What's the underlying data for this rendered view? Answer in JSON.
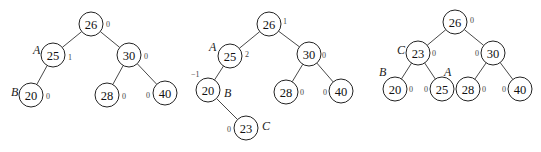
{
  "trees": [
    {
      "id": "tree-1",
      "nodes": [
        {
          "key": "n26",
          "value": "26",
          "x": 91,
          "y": 24,
          "bf": "0",
          "bf_dx": 15,
          "bf_dy": 0,
          "label": "",
          "label_dx": 0,
          "label_dy": 0
        },
        {
          "key": "n25",
          "value": "25",
          "x": 53,
          "y": 55,
          "bf": "1",
          "bf_dx": 15,
          "bf_dy": 2,
          "label": "A",
          "label_dx": -20,
          "label_dy": -5
        },
        {
          "key": "n30",
          "value": "30",
          "x": 129,
          "y": 55,
          "bf": "0",
          "bf_dx": 15,
          "bf_dy": 1,
          "label": "",
          "label_dx": 0,
          "label_dy": 0
        },
        {
          "key": "n20",
          "value": "20",
          "x": 31,
          "y": 95,
          "bf": "0",
          "bf_dx": 15,
          "bf_dy": 1,
          "label": "B",
          "label_dx": -20,
          "label_dy": -3
        },
        {
          "key": "n28",
          "value": "28",
          "x": 107,
          "y": 95,
          "bf": "0",
          "bf_dx": 15,
          "bf_dy": 1,
          "label": "",
          "label_dx": 0,
          "label_dy": 0
        },
        {
          "key": "n40",
          "value": "40",
          "x": 165,
          "y": 93,
          "bf": "0",
          "bf_dx": -19,
          "bf_dy": 2,
          "label": "",
          "label_dx": 0,
          "label_dy": 0
        }
      ],
      "edges": [
        [
          "n26",
          "n25"
        ],
        [
          "n26",
          "n30"
        ],
        [
          "n25",
          "n20"
        ],
        [
          "n30",
          "n28"
        ],
        [
          "n30",
          "n40"
        ]
      ]
    },
    {
      "id": "tree-2",
      "nodes": [
        {
          "key": "n26",
          "value": "26",
          "x": 269,
          "y": 24,
          "bf": "1",
          "bf_dx": 14,
          "bf_dy": -3,
          "label": "",
          "label_dx": 0,
          "label_dy": 0
        },
        {
          "key": "n25",
          "value": "25",
          "x": 230,
          "y": 56,
          "bf": "2",
          "bf_dx": 15,
          "bf_dy": -2,
          "label": "A",
          "label_dx": -21,
          "label_dy": -9
        },
        {
          "key": "n30",
          "value": "30",
          "x": 309,
          "y": 54,
          "bf": "0",
          "bf_dx": 13,
          "bf_dy": 1,
          "label": "",
          "label_dx": 0,
          "label_dy": 0
        },
        {
          "key": "n20",
          "value": "20",
          "x": 208,
          "y": 90,
          "bf": "−1",
          "bf_dx": -17,
          "bf_dy": -16,
          "label": "B",
          "label_dx": 16,
          "label_dy": 3
        },
        {
          "key": "n28",
          "value": "28",
          "x": 286,
          "y": 92,
          "bf": "0",
          "bf_dx": 14,
          "bf_dy": 0,
          "label": "",
          "label_dx": 0,
          "label_dy": 0
        },
        {
          "key": "n40",
          "value": "40",
          "x": 341,
          "y": 91,
          "bf": "0",
          "bf_dx": -18,
          "bf_dy": 1,
          "label": "",
          "label_dx": 0,
          "label_dy": 0
        },
        {
          "key": "n23",
          "value": "23",
          "x": 246,
          "y": 128,
          "bf": "0",
          "bf_dx": -19,
          "bf_dy": 1,
          "label": "C",
          "label_dx": 16,
          "label_dy": -2
        }
      ],
      "edges": [
        [
          "n26",
          "n25"
        ],
        [
          "n26",
          "n30"
        ],
        [
          "n25",
          "n20"
        ],
        [
          "n20",
          "n23"
        ],
        [
          "n30",
          "n28"
        ],
        [
          "n30",
          "n40"
        ]
      ]
    },
    {
      "id": "tree-3",
      "nodes": [
        {
          "key": "n26",
          "value": "26",
          "x": 455,
          "y": 22,
          "bf": "0",
          "bf_dx": 15,
          "bf_dy": -2,
          "label": "",
          "label_dx": 0,
          "label_dy": 0
        },
        {
          "key": "n23",
          "value": "23",
          "x": 418,
          "y": 53,
          "bf": "0",
          "bf_dx": 14,
          "bf_dy": 0,
          "label": "C",
          "label_dx": -21,
          "label_dy": -3
        },
        {
          "key": "n30",
          "value": "30",
          "x": 493,
          "y": 53,
          "bf": "0",
          "bf_dx": -18,
          "bf_dy": 0,
          "label": "",
          "label_dx": 0,
          "label_dy": 0
        },
        {
          "key": "n20",
          "value": "20",
          "x": 395,
          "y": 89,
          "bf": "0",
          "bf_dx": 14,
          "bf_dy": 0,
          "label": "B",
          "label_dx": -16,
          "label_dy": -17
        },
        {
          "key": "n25",
          "value": "25",
          "x": 442,
          "y": 89,
          "bf": "0",
          "bf_dx": -18,
          "bf_dy": 0,
          "label": "A",
          "label_dx": 2,
          "label_dy": -17
        },
        {
          "key": "n28",
          "value": "28",
          "x": 468,
          "y": 89,
          "bf": "0",
          "bf_dx": 14,
          "bf_dy": 0,
          "label": "",
          "label_dx": 0,
          "label_dy": 0
        },
        {
          "key": "n40",
          "value": "40",
          "x": 520,
          "y": 89,
          "bf": "0",
          "bf_dx": -18,
          "bf_dy": 0,
          "label": "",
          "label_dx": 0,
          "label_dy": 0
        }
      ],
      "edges": [
        [
          "n26",
          "n23"
        ],
        [
          "n26",
          "n30"
        ],
        [
          "n23",
          "n20"
        ],
        [
          "n23",
          "n25"
        ],
        [
          "n30",
          "n28"
        ],
        [
          "n30",
          "n40"
        ]
      ]
    }
  ],
  "style": {
    "node_radius": 12
  }
}
